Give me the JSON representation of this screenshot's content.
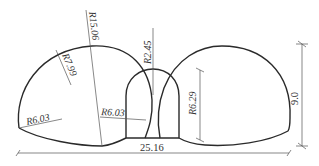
{
  "diagram": {
    "colors": {
      "outline": "#2a2a2a",
      "dimension": "#555555",
      "text": "#333333",
      "background": "#ffffff"
    },
    "labels": {
      "r_large": "R15.06",
      "r_left_crown": "R7.99",
      "r_left_sidewall": "R6.03",
      "r_middle_sidewall": "R6.03",
      "r_middle_crown": "R2.45",
      "r_right_height": "R6.29",
      "total_height": "9.0",
      "total_width": "25.16"
    },
    "dimensions": {
      "total_width_m": 25.16,
      "total_height_m": 9.0,
      "radii_m": [
        15.06,
        7.99,
        6.03,
        6.03,
        2.45,
        6.29
      ]
    }
  }
}
